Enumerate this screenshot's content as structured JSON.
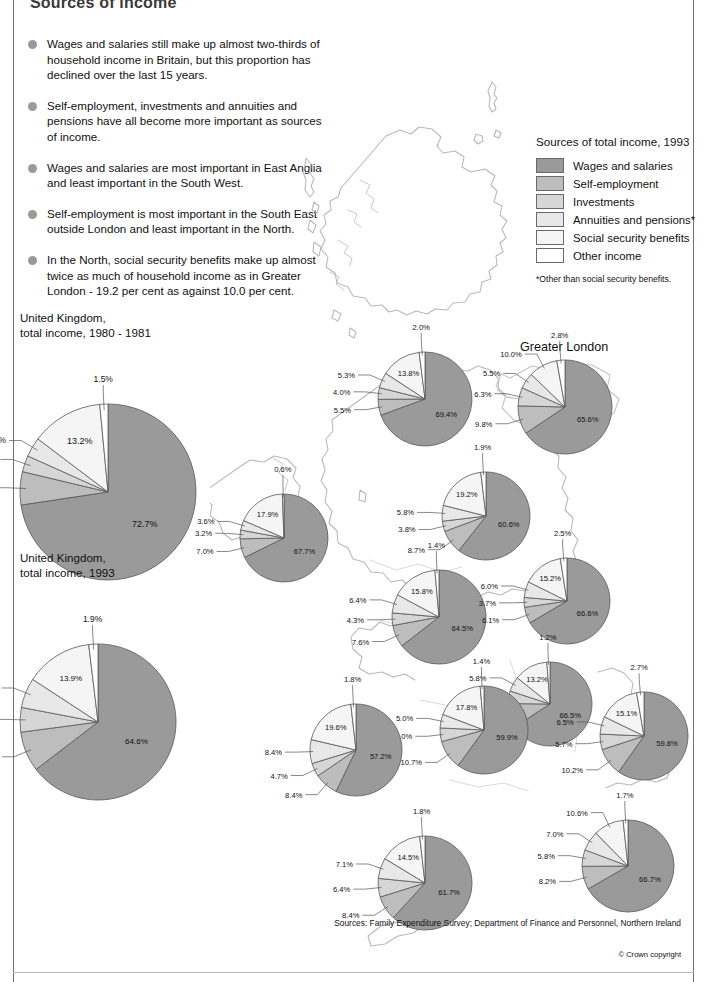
{
  "title": "Sources of income",
  "bullets": [
    "Wages and salaries still make up almost two-thirds of household income in Britain, but this proportion has declined over the last 15 years.",
    "Self-employment, investments and annuities and pensions have all become more important as sources of income.",
    "Wages and salaries are most important in East Anglia and least important in the South West.",
    "Self-employment is most important in the South East outside London and least important in the North.",
    "In the North, social security benefits make up almost twice as much of household income as in Greater London - 19.2 per cent as against 10.0 per cent."
  ],
  "legend": {
    "title": "Sources of total income, 1993",
    "items": [
      {
        "label": "Wages and salaries",
        "color": "#9a9a9a"
      },
      {
        "label": "Self-employment",
        "color": "#bdbdbd"
      },
      {
        "label": "Investments",
        "color": "#d6d6d6"
      },
      {
        "label": "Annuities and pensions*",
        "color": "#e8e8e8"
      },
      {
        "label": "Social security benefits",
        "color": "#f5f5f5"
      },
      {
        "label": "Other income",
        "color": "#ffffff"
      }
    ],
    "footnote": "*Other than social security benefits."
  },
  "greater_london_label": "Greater London",
  "sources": "Sources: Family Expenditure Survey;\nDepartment of Finance and Personnel, Northern Ireland",
  "copyright": "© Crown copyright",
  "chart_data": [
    {
      "type": "pie",
      "id": "uk-1980",
      "title": "United Kingdom,\ntotal income, 1980 - 1981",
      "categories": [
        "Wages and salaries",
        "Self-employment",
        "Investments",
        "Annuities and pensions",
        "Social security benefits",
        "Other income"
      ],
      "values": [
        72.7,
        6.1,
        3.0,
        3.6,
        13.2,
        1.5
      ],
      "labels": [
        "72.7%",
        "6.1%",
        "3.0%",
        "3.6%",
        "13.2%",
        "1.5%"
      ]
    },
    {
      "type": "pie",
      "id": "uk-1993",
      "title": "United Kingdom,\ntotal income, 1993",
      "categories": [
        "Wages and salaries",
        "Self-employment",
        "Investments",
        "Annuities and pensions",
        "Social security benefits",
        "Other income"
      ],
      "values": [
        64.6,
        8.3,
        5.1,
        6.2,
        13.9,
        1.9
      ],
      "labels": [
        "64.6%",
        "8.3%",
        "5.1%",
        "6.2%",
        "13.9%",
        "1.9%"
      ]
    },
    {
      "type": "pie",
      "id": "scotland",
      "title": "",
      "categories": [
        "Wages and salaries",
        "Self-employment",
        "Investments",
        "Annuities and pensions",
        "Social security benefits",
        "Other income"
      ],
      "values": [
        69.4,
        5.5,
        4.0,
        5.3,
        13.8,
        2.0
      ],
      "labels": [
        "69.4%",
        "5.5%",
        "4.0%",
        "5.3%",
        "13.8%",
        "2.0%"
      ]
    },
    {
      "type": "pie",
      "id": "northern-ireland",
      "title": "",
      "categories": [
        "Wages and salaries",
        "Self-employment",
        "Investments",
        "Annuities and pensions",
        "Social security benefits",
        "Other income"
      ],
      "values": [
        67.7,
        7.0,
        3.2,
        3.6,
        17.9,
        0.6
      ],
      "labels": [
        "67.7%",
        "7.0%",
        "3.2%",
        "3.6%",
        "17.9%",
        "0.6%"
      ]
    },
    {
      "type": "pie",
      "id": "north",
      "title": "",
      "categories": [
        "Wages and salaries",
        "Self-employment",
        "Investments",
        "Annuities and pensions",
        "Social security benefits",
        "Other income"
      ],
      "values": [
        60.6,
        8.7,
        3.8,
        5.8,
        19.2,
        1.9
      ],
      "labels": [
        "60.6%",
        "8.7%",
        "3.8%",
        "5.8%",
        "19.2%",
        "1.9%"
      ]
    },
    {
      "type": "pie",
      "id": "greater-london",
      "title": "Greater London",
      "categories": [
        "Wages and salaries",
        "Self-employment",
        "Investments",
        "Annuities and pensions",
        "Social security benefits",
        "Other income"
      ],
      "values": [
        65.6,
        9.8,
        6.3,
        5.5,
        10.0,
        2.8
      ],
      "labels": [
        "65.6%",
        "9.8%",
        "6.3%",
        "5.5%",
        "10.0%",
        "2.8%"
      ]
    },
    {
      "type": "pie",
      "id": "yorkshire-humberside",
      "title": "",
      "categories": [
        "Wages and salaries",
        "Self-employment",
        "Investments",
        "Annuities and pensions",
        "Social security benefits",
        "Other income"
      ],
      "values": [
        64.5,
        7.6,
        4.3,
        6.4,
        15.8,
        1.4
      ],
      "labels": [
        "64.5%",
        "7.6%",
        "4.3%",
        "6.4%",
        "15.8%",
        "1.4%"
      ]
    },
    {
      "type": "pie",
      "id": "east-anglia",
      "title": "",
      "categories": [
        "Wages and salaries",
        "Self-employment",
        "Investments",
        "Annuities and pensions",
        "Social security benefits",
        "Other income"
      ],
      "values": [
        66.6,
        6.1,
        3.7,
        6.0,
        15.2,
        2.5
      ],
      "labels": [
        "66.6%",
        "6.1%",
        "3.7%",
        "6.0%",
        "15.2%",
        "2.5%"
      ]
    },
    {
      "type": "pie",
      "id": "east-midlands",
      "title": "",
      "categories": [
        "Wages and salaries",
        "Self-employment",
        "Investments",
        "Annuities and pensions",
        "Social security benefits",
        "Other income"
      ],
      "values": [
        66.5,
        9.4,
        4.9,
        5.8,
        13.2,
        1.2
      ],
      "labels": [
        "66.5%",
        "9.4%",
        "4.9%",
        "5.8%",
        "13.2%",
        "1.2%"
      ]
    },
    {
      "type": "pie",
      "id": "west-midlands",
      "title": "",
      "categories": [
        "Wages and salaries",
        "Self-employment",
        "Investments",
        "Annuities and pensions",
        "Social security benefits",
        "Other income"
      ],
      "values": [
        59.9,
        10.7,
        5.0,
        5.0,
        17.8,
        1.4
      ],
      "labels": [
        "59.9%",
        "10.7%",
        "5.0%",
        "5.0%",
        "17.8%",
        "1.4%"
      ]
    },
    {
      "type": "pie",
      "id": "wales",
      "title": "",
      "categories": [
        "Wages and salaries",
        "Self-employment",
        "Investments",
        "Annuities and pensions",
        "Social security benefits",
        "Other income"
      ],
      "values": [
        57.2,
        8.4,
        4.7,
        8.4,
        19.6,
        1.8
      ],
      "labels": [
        "57.2%",
        "8.4%",
        "4.7%",
        "8.4%",
        "19.6%",
        "1.8%"
      ]
    },
    {
      "type": "pie",
      "id": "south-east",
      "title": "",
      "categories": [
        "Wages and salaries",
        "Self-employment",
        "Investments",
        "Annuities and pensions",
        "Social security benefits",
        "Other income"
      ],
      "values": [
        59.8,
        10.2,
        5.7,
        6.5,
        15.1,
        2.7
      ],
      "labels": [
        "59.8%",
        "10.2%",
        "5.7%",
        "6.5%",
        "15.1%",
        "2.7%"
      ]
    },
    {
      "type": "pie",
      "id": "south-west",
      "title": "",
      "categories": [
        "Wages and salaries",
        "Self-employment",
        "Investments",
        "Annuities and pensions",
        "Social security benefits",
        "Other income"
      ],
      "values": [
        61.7,
        8.4,
        6.4,
        7.1,
        14.5,
        1.8
      ],
      "labels": [
        "61.7%",
        "8.4%",
        "6.4%",
        "7.1%",
        "14.5%",
        "1.8%"
      ]
    },
    {
      "type": "pie",
      "id": "south-east-outside-london",
      "title": "",
      "categories": [
        "Wages and salaries",
        "Self-employment",
        "Investments",
        "Annuities and pensions",
        "Social security benefits",
        "Other income"
      ],
      "values": [
        66.7,
        8.2,
        5.8,
        7.0,
        10.6,
        1.7
      ],
      "labels": [
        "66.7%",
        "8.2%",
        "5.8%",
        "7.0%",
        "10.6%",
        "1.7%"
      ]
    }
  ],
  "pie_layout": {
    "uk-1980": {
      "left": 20,
      "top": 404,
      "r": 88,
      "cap_offset": 0,
      "label_font": 8.5,
      "big_label_font": 9
    },
    "uk-1993": {
      "left": 20,
      "top": 644,
      "r": 78,
      "cap_offset": 0,
      "label_font": 8.5,
      "big_label_font": 8
    },
    "scotland": {
      "left": 378,
      "top": 352,
      "r": 47
    },
    "northern-ireland": {
      "left": 240,
      "top": 494,
      "r": 44
    },
    "north": {
      "left": 442,
      "top": 472,
      "r": 44
    },
    "greater-london": {
      "left": 518,
      "top": 360,
      "r": 47
    },
    "yorkshire-humberside": {
      "left": 392,
      "top": 570,
      "r": 47
    },
    "east-anglia": {
      "left": 524,
      "top": 558,
      "r": 43
    },
    "east-midlands": {
      "left": 508,
      "top": 662,
      "r": 42
    },
    "west-midlands": {
      "left": 440,
      "top": 686,
      "r": 44
    },
    "wales": {
      "left": 310,
      "top": 704,
      "r": 46
    },
    "south-east": {
      "left": 600,
      "top": 692,
      "r": 44
    },
    "south-west": {
      "left": 378,
      "top": 836,
      "r": 47
    },
    "south-east-outside-london": {
      "left": 582,
      "top": 820,
      "r": 46
    }
  }
}
